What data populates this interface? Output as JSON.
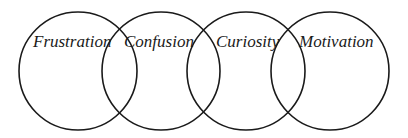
{
  "diagram": {
    "type": "overlapping-circles",
    "stroke_color": "#1a1a1a",
    "background": "#ffffff",
    "circles": [
      {
        "label": "Frustration",
        "cx": 78,
        "cy": 71,
        "r": 59,
        "label_x": 33
      },
      {
        "label": "Confusion",
        "cx": 161,
        "cy": 71,
        "r": 59,
        "label_x": 124
      },
      {
        "label": "Curiosity",
        "cx": 246,
        "cy": 71,
        "r": 59,
        "label_x": 216
      },
      {
        "label": "Motivation",
        "cx": 330,
        "cy": 71,
        "r": 59,
        "label_x": 299
      }
    ]
  }
}
